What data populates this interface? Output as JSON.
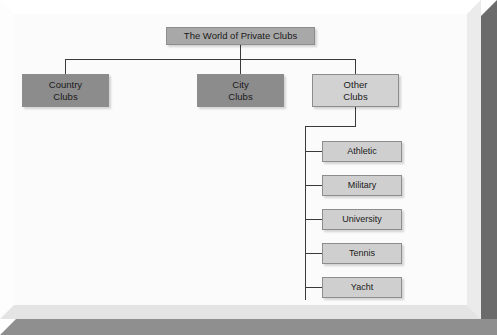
{
  "diagram": {
    "title": "The World of Private Clubs",
    "root": {
      "label": "The World of Private Clubs",
      "fill": "#a8a8a8"
    },
    "level2": [
      {
        "line1": "Country",
        "line2": "Clubs",
        "fill": "#8c8c8c"
      },
      {
        "line1": "City",
        "line2": "Clubs",
        "fill": "#8c8c8c"
      },
      {
        "line1": "Other",
        "line2": "Clubs",
        "fill": "#d2d2d2"
      }
    ],
    "level3": [
      {
        "label": "Athletic",
        "fill": "#cfcfcf"
      },
      {
        "label": "Military",
        "fill": "#cfcfcf"
      },
      {
        "label": "University",
        "fill": "#cfcfcf"
      },
      {
        "label": "Tennis",
        "fill": "#cfcfcf"
      },
      {
        "label": "Yacht",
        "fill": "#cfcfcf"
      }
    ],
    "colors": {
      "connector": "#3a3a3a",
      "canvas": "#fbfbfb",
      "frame": "#ffffff",
      "shadow": "#6b6b6b"
    }
  }
}
